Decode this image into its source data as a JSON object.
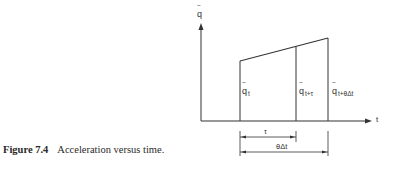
{
  "figure": {
    "number": "Figure 7.4",
    "caption": "Acceleration versus time."
  },
  "axes": {
    "y_label": "q",
    "x_label": "t"
  },
  "labels": {
    "q_t": {
      "base": "q",
      "sub": "t"
    },
    "q_t_tau": {
      "base": "q",
      "sub": "t+τ"
    },
    "q_t_theta": {
      "base": "q",
      "sub": "t+θΔt"
    }
  },
  "dimensions": {
    "tau": "τ",
    "theta_dt": "θΔt"
  },
  "colors": {
    "line": "#333333",
    "text": "#2a2a2a"
  }
}
